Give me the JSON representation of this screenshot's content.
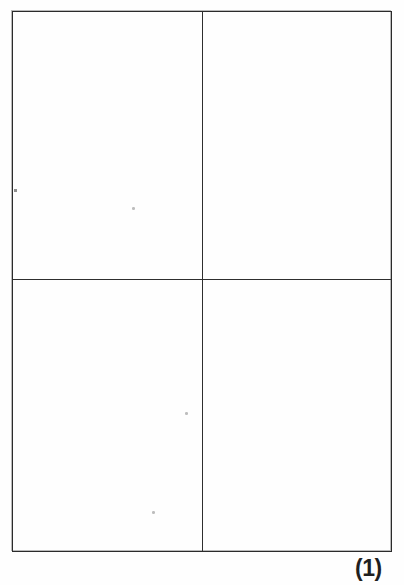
{
  "document": {
    "background_color": "#ffffff",
    "ink_color": "#2b2b2b"
  },
  "figure": {
    "caption": "(1)",
    "shape": "rectangle",
    "subdivision": "2x2 quadrant grid",
    "border_color": "#2b2b2b",
    "divider_color": "#2e2e2e",
    "quadrants": [
      {
        "id": "top-left",
        "content": ""
      },
      {
        "id": "top-right",
        "content": ""
      },
      {
        "id": "bottom-left",
        "content": ""
      },
      {
        "id": "bottom-right",
        "content": ""
      }
    ]
  }
}
